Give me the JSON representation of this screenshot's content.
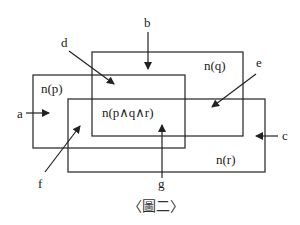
{
  "diagram": {
    "sets": [
      {
        "id": "p",
        "label": "n(p)",
        "rect": {
          "x": 33,
          "y": 75,
          "w": 152,
          "h": 73
        }
      },
      {
        "id": "q",
        "label": "n(q)",
        "rect": {
          "x": 92,
          "y": 52,
          "w": 151,
          "h": 84
        }
      },
      {
        "id": "r",
        "label": "n(r)",
        "rect": {
          "x": 68,
          "y": 99,
          "w": 197,
          "h": 73
        }
      }
    ],
    "intersection_label": "n(p∧q∧r)",
    "pointers": [
      {
        "id": "a",
        "label": "a"
      },
      {
        "id": "b",
        "label": "b"
      },
      {
        "id": "c",
        "label": "c"
      },
      {
        "id": "d",
        "label": "d"
      },
      {
        "id": "e",
        "label": "e"
      },
      {
        "id": "f",
        "label": "f"
      },
      {
        "id": "g",
        "label": "g"
      }
    ],
    "caption": "〈圖二〉",
    "colors": {
      "line": "#222222",
      "text": "#222222",
      "background": "#ffffff"
    }
  }
}
